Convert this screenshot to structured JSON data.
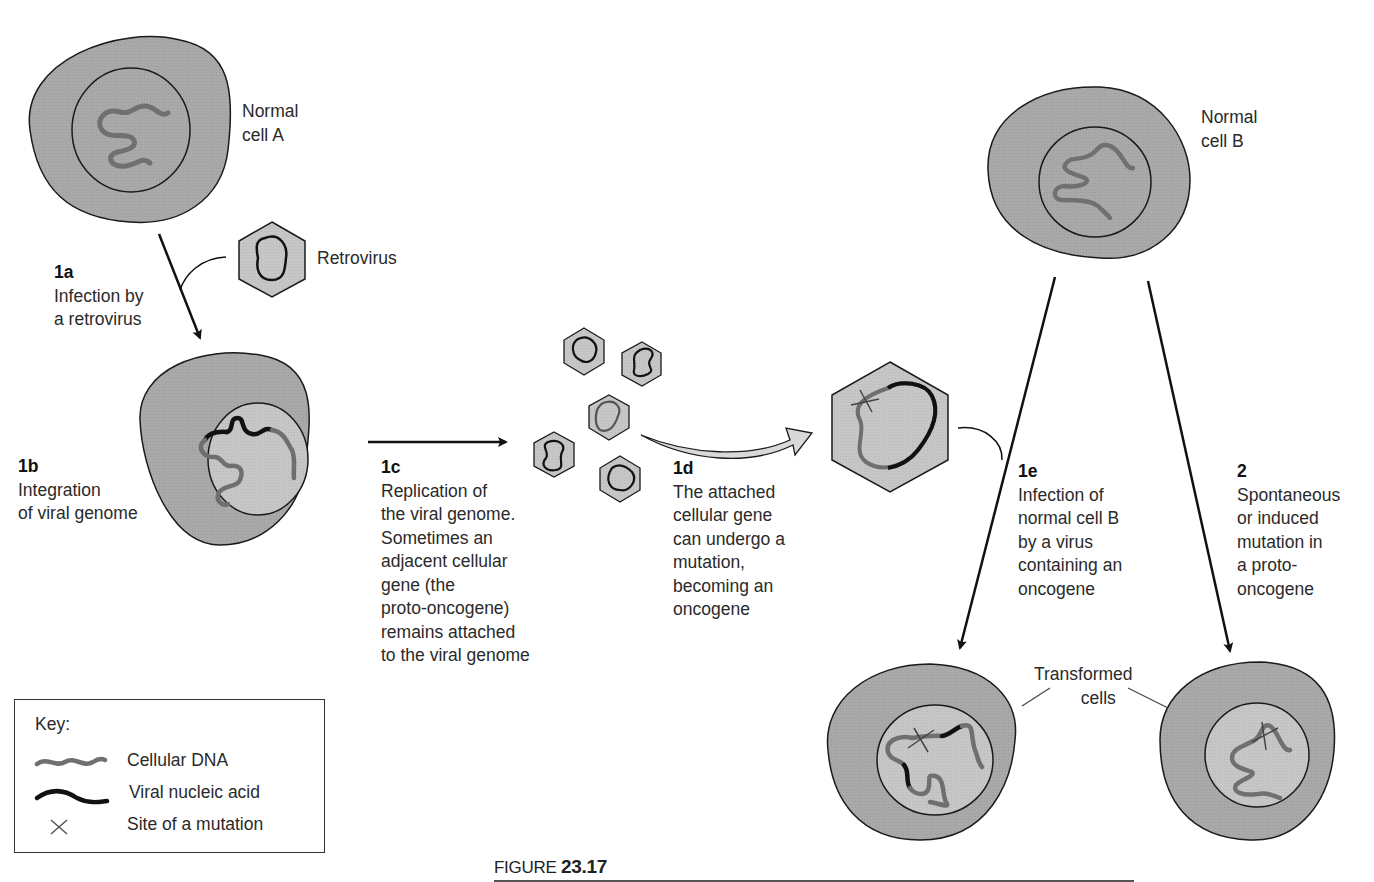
{
  "figure": {
    "prefix": "FIGURE",
    "number": "23.17"
  },
  "colors": {
    "cytoplasm": "#a9a9a9",
    "nucleus": "#c9c9c9",
    "virus_fill": "#d6d6d6",
    "cellular_dna": "#6f6f6f",
    "viral_nucleic_acid": "#111111",
    "outline": "#1a1a1a"
  },
  "cells": {
    "normal_a": {
      "label_line1": "Normal",
      "label_line2": "cell A"
    },
    "normal_b": {
      "label_line1": "Normal",
      "label_line2": "cell B"
    },
    "transformed": {
      "label_line1": "Transformed",
      "label_line2": "cells"
    }
  },
  "retrovirus": {
    "label": "Retrovirus"
  },
  "steps": [
    {
      "id": "1a",
      "lines": [
        "Infection by",
        "a retrovirus"
      ]
    },
    {
      "id": "1b",
      "lines": [
        "Integration",
        "of viral genome"
      ]
    },
    {
      "id": "1c",
      "lines": [
        "Replication of",
        "the viral genome.",
        "Sometimes an",
        "adjacent cellular",
        "gene (the",
        "proto-oncogene)",
        "remains attached",
        "to the viral genome"
      ]
    },
    {
      "id": "1d",
      "lines": [
        "The attached",
        "cellular gene",
        "can undergo a",
        "mutation,",
        "becoming an",
        "oncogene"
      ]
    },
    {
      "id": "1e",
      "lines": [
        "Infection of",
        "normal cell B",
        "by a virus",
        "containing an",
        "oncogene"
      ]
    },
    {
      "id": "2",
      "lines": [
        "Spontaneous",
        "or induced",
        "mutation in",
        "a proto-",
        "oncogene"
      ]
    }
  ],
  "key": {
    "title": "Key:",
    "items": [
      {
        "symbol": "gray-wavy-line",
        "label": "Cellular DNA"
      },
      {
        "symbol": "black-wavy-line",
        "label": "Viral nucleic acid"
      },
      {
        "symbol": "x-mark",
        "label": "Site of a mutation"
      }
    ]
  }
}
